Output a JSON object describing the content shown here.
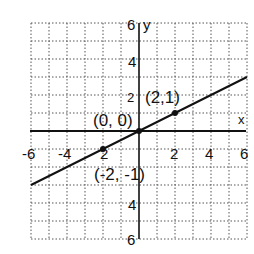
{
  "chart_data": {
    "type": "line",
    "title": "",
    "xlabel": "x",
    "ylabel": "y",
    "xlim": [
      -6,
      6
    ],
    "ylim": [
      -6,
      6
    ],
    "grid": true,
    "grid_style": "dotted",
    "grid_step": 1,
    "x_ticks": [
      -6,
      -4,
      -2,
      2,
      4,
      6
    ],
    "y_ticks": [
      6,
      4,
      2,
      -4,
      -6
    ],
    "x_tick_labels": [
      "-6",
      "-4",
      "2",
      "2",
      "4",
      "6"
    ],
    "y_tick_labels": [
      "6",
      "4",
      "2",
      "4",
      "6"
    ],
    "series": [
      {
        "name": "y = x/2",
        "x": [
          -6,
          6
        ],
        "y": [
          -3,
          3
        ]
      }
    ],
    "points": [
      {
        "x": -2,
        "y": -1,
        "label": "(-2, -1)"
      },
      {
        "x": 0,
        "y": 0,
        "label": "(0, 0)"
      },
      {
        "x": 2,
        "y": 1,
        "label": "(2,1)"
      }
    ]
  },
  "labels": {
    "x_axis": "x",
    "y_axis": "y",
    "pt_neg": "(-2, -1)",
    "pt_origin": "(0, 0)",
    "pt_pos": "(2,1)",
    "xt_m6": "-6",
    "xt_m4": "-4",
    "xt_m2": "2",
    "xt_2": "2",
    "xt_4": "4",
    "xt_6": "6",
    "yt_6": "6",
    "yt_4": "4",
    "yt_2": "2",
    "yt_m4": "4",
    "yt_m6": "6"
  },
  "colors": {
    "ink": "#111111",
    "grid": "#555555",
    "background": "#ffffff"
  }
}
